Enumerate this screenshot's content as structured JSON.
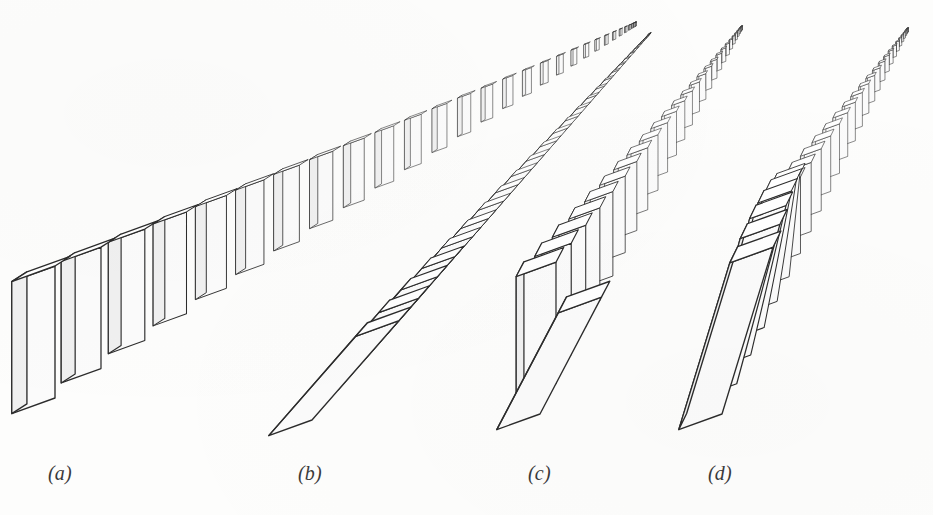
{
  "figure": {
    "kind": "line-art-perspective-illustration",
    "width": 933,
    "height": 515,
    "background_color": "#fdfdfc",
    "stroke_color": "#2c2c2c",
    "face_top_color": "#ffffff",
    "face_front_color": "#fbfbfb",
    "face_side_color": "#f0f0f0"
  },
  "labels": [
    {
      "id": "a",
      "text": "(a)",
      "x": 48,
      "y": 462
    },
    {
      "id": "b",
      "text": "(b)",
      "x": 298,
      "y": 462
    },
    {
      "id": "c",
      "text": "(c)",
      "x": 528,
      "y": 462
    },
    {
      "id": "d",
      "text": "(d)",
      "x": 708,
      "y": 462
    }
  ],
  "rows": [
    {
      "id": "a",
      "label": "(a)",
      "state": "all upright standing",
      "near_x": 55,
      "near_y": 398,
      "vanish_x": 636,
      "vanish_y": 26,
      "count": 30,
      "near_width": 46,
      "near_height": 132,
      "near_depth": 18,
      "lean_start_index": 99,
      "lean_max_deg": 0,
      "flat_count": 0
    },
    {
      "id": "b",
      "label": "(b)",
      "state": "all fallen flat, overlapping chain",
      "near_x": 312,
      "near_y": 420,
      "vanish_x": 648,
      "vanish_y": 36,
      "count": 30,
      "near_width": 46,
      "near_height": 132,
      "near_depth": 18,
      "lean_start_index": 0,
      "lean_max_deg": 90,
      "flat_count": 30
    },
    {
      "id": "c",
      "label": "(c)",
      "state": "first domino fallen flat, remainder upright",
      "near_x": 540,
      "near_y": 414,
      "vanish_x": 742,
      "vanish_y": 30,
      "count": 30,
      "near_width": 46,
      "near_height": 132,
      "near_depth": 18,
      "lean_start_index": 1,
      "lean_max_deg": 0,
      "flat_count": 1
    },
    {
      "id": "d",
      "label": "(d)",
      "state": "toppling wave: front dominoes leaning on each other, rear upright",
      "near_x": 722,
      "near_y": 414,
      "vanish_x": 908,
      "vanish_y": 32,
      "count": 30,
      "near_width": 46,
      "near_height": 132,
      "near_depth": 18,
      "lean_start_index": 6,
      "lean_max_deg": 62,
      "flat_count": 0
    }
  ]
}
